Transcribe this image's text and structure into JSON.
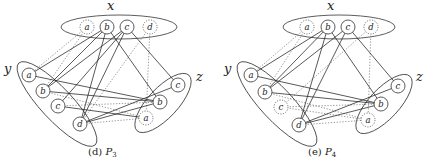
{
  "panels": [
    {
      "id": "P3",
      "caption_prefix": "(d) ",
      "caption_name": "P",
      "caption_sub": "3",
      "caption_pos": [
        88,
        155
      ],
      "groups": [
        {
          "name": "x",
          "label_pos": [
            107,
            10
          ],
          "ellipse": {
            "cx": 119,
            "cy": 27,
            "rx": 58,
            "ry": 12,
            "rot": 0
          },
          "nodes": [
            {
              "id": "xa",
              "label": "a",
              "x": 87,
              "y": 27,
              "style": "dotted"
            },
            {
              "id": "xb",
              "label": "b",
              "x": 107,
              "y": 27,
              "style": "solid"
            },
            {
              "id": "xc",
              "label": "c",
              "x": 127,
              "y": 27,
              "style": "solid"
            },
            {
              "id": "xd",
              "label": "d",
              "x": 150,
              "y": 27,
              "style": "dotted"
            }
          ]
        },
        {
          "name": "y",
          "label_pos": [
            4,
            73
          ],
          "ellipse": {
            "cx": 57,
            "cy": 104,
            "rx": 56,
            "ry": 16,
            "rot": 47
          },
          "nodes": [
            {
              "id": "ya",
              "label": "a",
              "x": 29,
              "y": 75,
              "style": "solid"
            },
            {
              "id": "yb",
              "label": "b",
              "x": 43,
              "y": 91,
              "style": "solid"
            },
            {
              "id": "yc",
              "label": "c",
              "x": 58,
              "y": 106,
              "style": "solid"
            },
            {
              "id": "yd",
              "label": "d",
              "x": 80,
              "y": 124,
              "style": "solid"
            }
          ]
        },
        {
          "name": "z",
          "label_pos": [
            196,
            81
          ],
          "ellipse": {
            "cx": 163,
            "cy": 103,
            "rx": 38,
            "ry": 15,
            "rot": -47
          },
          "nodes": [
            {
              "id": "zc",
              "label": "c",
              "x": 178,
              "y": 85,
              "style": "solid"
            },
            {
              "id": "zb",
              "label": "b",
              "x": 160,
              "y": 102,
              "style": "solid"
            },
            {
              "id": "za",
              "label": "a",
              "x": 146,
              "y": 118,
              "style": "dotted"
            }
          ]
        }
      ],
      "solid_edges": [
        [
          "xb",
          "ya"
        ],
        [
          "xb",
          "yb"
        ],
        [
          "xb",
          "yd"
        ],
        [
          "xb",
          "zb"
        ],
        [
          "xc",
          "yb"
        ],
        [
          "xc",
          "yc"
        ],
        [
          "xc",
          "yd"
        ],
        [
          "xc",
          "zc"
        ],
        [
          "ya",
          "zb"
        ],
        [
          "yb",
          "zb"
        ],
        [
          "yc",
          "za"
        ],
        [
          "yd",
          "zc"
        ],
        [
          "yd",
          "zb"
        ]
      ],
      "dotted_edges": [
        [
          "xa",
          "ya"
        ],
        [
          "xa",
          "yb"
        ],
        [
          "xd",
          "yd"
        ],
        [
          "xd",
          "za"
        ],
        [
          "yd",
          "za"
        ],
        [
          "yc",
          "zb"
        ],
        [
          "yb",
          "za"
        ]
      ]
    },
    {
      "id": "P4",
      "caption_prefix": "(e) ",
      "caption_name": "P",
      "caption_sub": "4",
      "caption_pos": [
        308,
        155
      ],
      "groups": [
        {
          "name": "x",
          "label_pos": [
            327,
            10
          ],
          "ellipse": {
            "cx": 339,
            "cy": 27,
            "rx": 56,
            "ry": 12,
            "rot": 0
          },
          "nodes": [
            {
              "id": "xa",
              "label": "a",
              "x": 307,
              "y": 27,
              "style": "dotted"
            },
            {
              "id": "xb",
              "label": "b",
              "x": 328,
              "y": 27,
              "style": "solid"
            },
            {
              "id": "xc",
              "label": "c",
              "x": 348,
              "y": 27,
              "style": "solid"
            },
            {
              "id": "xd",
              "label": "d",
              "x": 371,
              "y": 27,
              "style": "dotted"
            }
          ]
        },
        {
          "name": "y",
          "label_pos": [
            224,
            73
          ],
          "ellipse": {
            "cx": 277,
            "cy": 104,
            "rx": 56,
            "ry": 16,
            "rot": 47
          },
          "nodes": [
            {
              "id": "ya",
              "label": "a",
              "x": 251,
              "y": 75,
              "style": "solid"
            },
            {
              "id": "yb",
              "label": "b",
              "x": 265,
              "y": 92,
              "style": "solid"
            },
            {
              "id": "yc",
              "label": "c",
              "x": 281,
              "y": 107,
              "style": "dotted"
            },
            {
              "id": "yd",
              "label": "d",
              "x": 299,
              "y": 125,
              "style": "solid"
            }
          ]
        },
        {
          "name": "z",
          "label_pos": [
            416,
            81
          ],
          "ellipse": {
            "cx": 384,
            "cy": 104,
            "rx": 38,
            "ry": 15,
            "rot": -47
          },
          "nodes": [
            {
              "id": "zc",
              "label": "c",
              "x": 398,
              "y": 86,
              "style": "solid"
            },
            {
              "id": "zb",
              "label": "b",
              "x": 381,
              "y": 104,
              "style": "solid"
            },
            {
              "id": "za",
              "label": "a",
              "x": 368,
              "y": 120,
              "style": "dotted"
            }
          ]
        }
      ],
      "solid_edges": [
        [
          "xb",
          "ya"
        ],
        [
          "xb",
          "yb"
        ],
        [
          "xb",
          "yd"
        ],
        [
          "xb",
          "zb"
        ],
        [
          "xc",
          "yb"
        ],
        [
          "xc",
          "yd"
        ],
        [
          "xc",
          "zc"
        ],
        [
          "ya",
          "zb"
        ],
        [
          "yb",
          "zb"
        ],
        [
          "yd",
          "zc"
        ],
        [
          "yd",
          "zb"
        ]
      ],
      "dotted_edges": [
        [
          "xa",
          "ya"
        ],
        [
          "xa",
          "yb"
        ],
        [
          "xd",
          "yc"
        ],
        [
          "xd",
          "za"
        ],
        [
          "yc",
          "za"
        ],
        [
          "yd",
          "za"
        ],
        [
          "yb",
          "za"
        ],
        [
          "yc",
          "zb"
        ]
      ]
    }
  ],
  "node_radius": 7
}
